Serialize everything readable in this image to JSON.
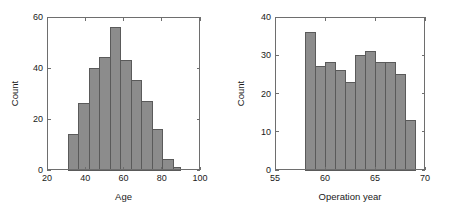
{
  "figure": {
    "background_color": "#ffffff",
    "bar_fill_color": "#8c8c8c",
    "bar_edge_color": "#5a5a5a",
    "axis_color": "#6e6e6e",
    "text_color": "#1a1a1a"
  },
  "chart_data": [
    {
      "type": "bar",
      "subtype": "histogram",
      "title": "",
      "xlabel": "Age",
      "ylabel": "Count",
      "xlim": [
        20,
        100
      ],
      "ylim": [
        0,
        60
      ],
      "xticks": [
        20,
        40,
        60,
        80,
        100
      ],
      "xticklabels": [
        "20",
        "40",
        "60",
        "80",
        "100"
      ],
      "yticks": [
        0,
        20,
        40,
        60
      ],
      "yticklabels": [
        "0",
        "20",
        "40",
        "60"
      ],
      "grid": false,
      "legend": null,
      "bin_edges": [
        31,
        36.5,
        42,
        47.5,
        53,
        58.5,
        64,
        69.5,
        75,
        80.5,
        86
      ],
      "bin_centers": [
        33.75,
        39.25,
        44.75,
        50.25,
        55.75,
        61.25,
        66.75,
        72.25,
        77.75,
        83.25
      ],
      "values": [
        14,
        26,
        40,
        44,
        56,
        43,
        35,
        27,
        16,
        4
      ],
      "extra_bin": {
        "center": 88,
        "edges": [
          86,
          90
        ],
        "value": 1
      }
    },
    {
      "type": "bar",
      "subtype": "histogram",
      "title": "",
      "xlabel": "Operation year",
      "ylabel": "Count",
      "xlim": [
        55,
        70
      ],
      "ylim": [
        0,
        40
      ],
      "xticks": [
        55,
        60,
        65,
        70
      ],
      "xticklabels": [
        "55",
        "60",
        "65",
        "70"
      ],
      "yticks": [
        0,
        10,
        20,
        30,
        40
      ],
      "yticklabels": [
        "0",
        "10",
        "20",
        "30",
        "40"
      ],
      "grid": false,
      "legend": null,
      "bin_edges": [
        58,
        59,
        60,
        61,
        62,
        63,
        64,
        65,
        66,
        67,
        68,
        69
      ],
      "bin_centers": [
        58.5,
        59.5,
        60.5,
        61.5,
        62.5,
        63.5,
        64.5,
        65.5,
        66.5,
        67.5,
        68.5
      ],
      "values": [
        36,
        27,
        28,
        26,
        23,
        30,
        31,
        28,
        28,
        25,
        13
      ]
    }
  ]
}
